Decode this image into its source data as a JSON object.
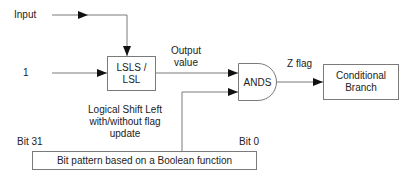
{
  "diagram": {
    "inputs": {
      "input_label": "Input",
      "one_label": "1"
    },
    "shift_block": {
      "label_line1": "LSLS /",
      "label_line2": "LSL",
      "description_line1": "Logical Shift Left",
      "description_line2": "with/without flag",
      "description_line3": "update"
    },
    "output_label_line1": "Output",
    "output_label_line2": "value",
    "and_gate": {
      "label": "ANDS"
    },
    "z_flag_label": "Z flag",
    "branch_block": {
      "label_line1": "Conditional",
      "label_line2": "Branch"
    },
    "bit_pattern": {
      "label": "Bit pattern based on a Boolean function",
      "msb_label": "Bit 31",
      "lsb_label": "Bit 0"
    },
    "colors": {
      "line": "#7a7a7a",
      "arrow": "#111111",
      "text": "#222222"
    }
  }
}
